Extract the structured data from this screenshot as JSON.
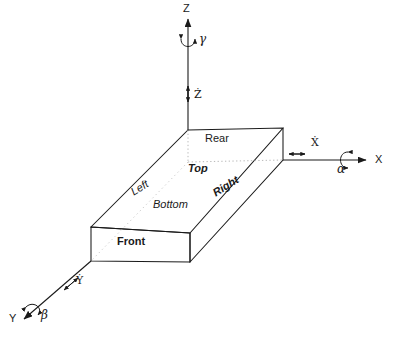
{
  "diagram": {
    "stroke_color": "#1a1a1a",
    "hidden_edge_color": "#9a9a9a",
    "background": "#ffffff"
  },
  "axes": [
    {
      "id": "z",
      "label": "Z",
      "name": "z-axis"
    },
    {
      "id": "x",
      "label": "X",
      "name": "x-axis"
    },
    {
      "id": "y",
      "label": "Y",
      "name": "y-axis"
    }
  ],
  "rotations": [
    {
      "id": "alpha",
      "label": "α",
      "about": "X",
      "name": "alpha-rotation"
    },
    {
      "id": "beta",
      "label": "β",
      "about": "Y",
      "name": "beta-rotation"
    },
    {
      "id": "gamma",
      "label": "γ",
      "about": "Z",
      "name": "gamma-rotation"
    }
  ],
  "translations": [
    {
      "id": "xdot",
      "label": "Ẋ",
      "base": "X",
      "name": "x-dot-translation"
    },
    {
      "id": "ydot",
      "label": "Ẏ",
      "base": "Y",
      "name": "y-dot-translation"
    },
    {
      "id": "zdot",
      "label": "Ż",
      "base": "Z",
      "name": "z-dot-translation"
    }
  ],
  "faces": [
    {
      "id": "rear",
      "label": "Rear",
      "style": "plain"
    },
    {
      "id": "top",
      "label": "Top",
      "style": "bold-italic"
    },
    {
      "id": "left",
      "label": "Left",
      "style": "italic"
    },
    {
      "id": "bottom",
      "label": "Bottom",
      "style": "italic"
    },
    {
      "id": "right",
      "label": "Right",
      "style": "bold-italic"
    },
    {
      "id": "front",
      "label": "Front",
      "style": "bold"
    }
  ]
}
